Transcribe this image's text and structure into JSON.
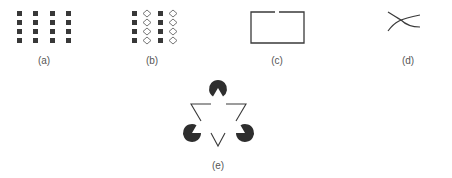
{
  "figure": {
    "panels": [
      {
        "id": "a",
        "label": "(a)",
        "description": "4x4 grid of filled squares (proximity)"
      },
      {
        "id": "b",
        "label": "(b)",
        "description": "columns alternating filled squares and hollow diamonds (similarity)"
      },
      {
        "id": "c",
        "label": "(c)",
        "description": "rectangle outline with small gap at top (closure)"
      },
      {
        "id": "d",
        "label": "(d)",
        "description": "two crossing curved lines (continuity)"
      },
      {
        "id": "e",
        "label": "(e)",
        "description": "Kanizsa illusory triangle with three pac-man discs"
      }
    ],
    "colors": {
      "ink": "#3a3a3a",
      "fill": "#333333",
      "label": "#555555",
      "background": "#ffffff"
    }
  }
}
